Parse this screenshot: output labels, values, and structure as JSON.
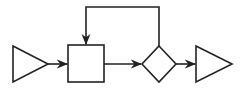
{
  "diagram": {
    "type": "block-flow-diagram",
    "stroke_color": "#222222",
    "background": "#ffffff",
    "nodes": [
      {
        "id": "input",
        "shape": "triangle",
        "label": ""
      },
      {
        "id": "process",
        "shape": "square",
        "label": ""
      },
      {
        "id": "decision",
        "shape": "diamond",
        "label": ""
      },
      {
        "id": "output",
        "shape": "triangle",
        "label": ""
      }
    ],
    "edges": [
      {
        "from": "input",
        "to": "process"
      },
      {
        "from": "process",
        "to": "decision"
      },
      {
        "from": "decision",
        "to": "output"
      },
      {
        "from": "decision",
        "to": "process",
        "kind": "feedback"
      }
    ]
  }
}
